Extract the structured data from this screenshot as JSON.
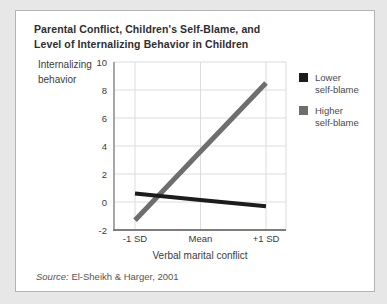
{
  "page": {
    "background": "#e7e7e7"
  },
  "card": {
    "title": "Parental Conflict, Children's Self-Blame, and\nLevel of Internalizing Behavior in Children",
    "source_label": "Source:",
    "source_value": "El-Sheikh & Harger, 2001"
  },
  "axes": {
    "y_label": "Internalizing\nbehavior",
    "x_label": "Verbal marital conflict"
  },
  "legend": {
    "items": [
      {
        "label": "Lower\nself-blame",
        "color": "#1c1c1c"
      },
      {
        "label": "Higher\nself-blame",
        "color": "#6e6e6e"
      }
    ]
  },
  "chart_data": {
    "type": "line",
    "title": "Parental Conflict, Children's Self-Blame, and Level of Internalizing Behavior in Children",
    "categories": [
      "-1 SD",
      "Mean",
      "+1 SD"
    ],
    "series": [
      {
        "name": "Lower self-blame",
        "color": "#1c1c1c",
        "values": [
          0.6,
          0.15,
          -0.3
        ]
      },
      {
        "name": "Higher self-blame",
        "color": "#6e6e6e",
        "values": [
          -1.3,
          3.6,
          8.5
        ]
      }
    ],
    "xlabel": "Verbal marital conflict",
    "ylabel": "Internalizing behavior",
    "ylim": [
      -2,
      10
    ],
    "ytick_step": 2,
    "grid": true,
    "legend_position": "right",
    "source": "Source: El-Sheikh & Harger, 2001"
  }
}
